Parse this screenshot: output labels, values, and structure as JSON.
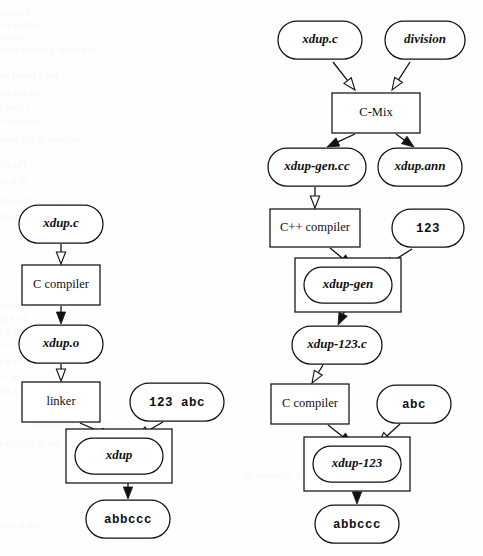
{
  "figure": {
    "type": "diagram",
    "background_color": "#fefefe",
    "stroke_color": "#111111",
    "fill_color": "#ffffff"
  },
  "ghost_text": {
    "description": "faint bleed-through text from reverse of scanned page",
    "color": "#f7f7f8",
    "lines": [
      {
        "x": 30,
        "y": 8,
        "text": "the use was a similar on the mode of"
      },
      {
        "x": 40,
        "y": 20,
        "text": "partial evaluation it is. While the block"
      },
      {
        "x": 24,
        "y": 32,
        "text": "results would be a copy to the ' prediction', and"
      },
      {
        "x": 95,
        "y": 45,
        "text": "the other a reason of error"
      },
      {
        "x": 58,
        "y": 70,
        "text": "for a result in a suppose"
      },
      {
        "x": 40,
        "y": 88,
        "text": "we see the know on that C-Mix  has  passes"
      },
      {
        "x": 30,
        "y": 102,
        "text": "a time of propagate, with suffix, depth in"
      },
      {
        "x": 38,
        "y": 116,
        "text": "suppress of several blocks, in line more states"
      },
      {
        "x": 80,
        "y": 135,
        "text": "of error in the extent of the"
      },
      {
        "x": 28,
        "y": 160,
        "text": "The fixed on a new program, and the compiler"
      },
      {
        "x": 28,
        "y": 176,
        "text": "of a partial evaluation to the same line and a of"
      },
      {
        "x": 30,
        "y": 195,
        "text": "on a section of our quality, a mix of the check"
      },
      {
        "x": 38,
        "y": 212,
        "text": "on a same. As a mapped to the as not the"
      },
      {
        "x": 30,
        "y": 300,
        "text": "and this on a mapping and the section of the"
      },
      {
        "x": 28,
        "y": 313,
        "text": "on a page 13 with an more to the a 1 old, the"
      },
      {
        "x": 26,
        "y": 326,
        "text": "but a on a partial section. The it. a model of"
      },
      {
        "x": 34,
        "y": 339,
        "text": "we or a C-Mix of the same line."
      },
      {
        "x": 28,
        "y": 356,
        "text": "The a few passes to some of a generated (a)"
      },
      {
        "x": 30,
        "y": 372,
        "text": "to or a suppose of the section of the"
      },
      {
        "x": 30,
        "y": 386,
        "text": "on a more on the section on line a a and not"
      },
      {
        "x": 120,
        "y": 420,
        "text": "evaluation to analyze"
      },
      {
        "x": 60,
        "y": 438,
        "text": "the if a mix a of the"
      },
      {
        "x": 300,
        "y": 470,
        "text": "a a section of"
      },
      {
        "x": 40,
        "y": 520,
        "text": "the a section of and the of a"
      }
    ]
  },
  "nodes": [
    {
      "id": "xdup-c-right",
      "label": "xdup.c",
      "shape": "stadium",
      "style": "bolditalic",
      "cx": 320,
      "cy": 40,
      "w": 84,
      "h": 38,
      "boxed": false
    },
    {
      "id": "division",
      "label": "division",
      "shape": "stadium",
      "style": "bolditalic",
      "cx": 425,
      "cy": 40,
      "w": 80,
      "h": 38,
      "boxed": false
    },
    {
      "id": "c-mix",
      "label": "C-Mix",
      "shape": "rect",
      "style": "plain",
      "cx": 376,
      "cy": 113,
      "w": 88,
      "h": 40,
      "boxed": false
    },
    {
      "id": "xdup-gen-cc",
      "label": "xdup-gen.cc",
      "shape": "stadium",
      "style": "bolditalic",
      "cx": 317,
      "cy": 167,
      "w": 98,
      "h": 38,
      "boxed": false
    },
    {
      "id": "xdup-ann",
      "label": "xdup.ann",
      "shape": "stadium",
      "style": "bolditalic",
      "cx": 420,
      "cy": 167,
      "w": 84,
      "h": 38,
      "boxed": false
    },
    {
      "id": "cpp-compiler",
      "label": "C++ compiler",
      "shape": "rect",
      "style": "plain",
      "cx": 315,
      "cy": 228,
      "w": 90,
      "h": 38,
      "boxed": false
    },
    {
      "id": "const-123",
      "label": "123",
      "shape": "stadium",
      "style": "mono",
      "cx": 428,
      "cy": 228,
      "w": 72,
      "h": 38,
      "boxed": false
    },
    {
      "id": "xdup-gen",
      "label": "xdup-gen",
      "shape": "stadium",
      "style": "bolditalic",
      "cx": 348,
      "cy": 285,
      "w": 88,
      "h": 36,
      "boxed": true
    },
    {
      "id": "xdup-123-c",
      "label": "xdup-123.c",
      "shape": "stadium",
      "style": "bolditalic",
      "cx": 337,
      "cy": 345,
      "w": 90,
      "h": 38,
      "boxed": false
    },
    {
      "id": "c-compiler-r",
      "label": "C compiler",
      "shape": "rect",
      "style": "plain",
      "cx": 310,
      "cy": 404,
      "w": 78,
      "h": 40,
      "boxed": false
    },
    {
      "id": "abc",
      "label": "abc",
      "shape": "stadium",
      "style": "mono",
      "cx": 414,
      "cy": 404,
      "w": 74,
      "h": 38,
      "boxed": false
    },
    {
      "id": "xdup-123",
      "label": "xdup-123",
      "shape": "stadium",
      "style": "bolditalic",
      "cx": 357,
      "cy": 464,
      "w": 88,
      "h": 36,
      "boxed": true
    },
    {
      "id": "abbccc-right",
      "label": "abbccc",
      "shape": "stadium",
      "style": "mono",
      "cx": 357,
      "cy": 524,
      "w": 84,
      "h": 38,
      "boxed": false
    },
    {
      "id": "xdup-c-left",
      "label": "xdup.c",
      "shape": "stadium",
      "style": "bolditalic",
      "cx": 61,
      "cy": 224,
      "w": 84,
      "h": 38,
      "boxed": false
    },
    {
      "id": "c-compiler-l",
      "label": "C compiler",
      "shape": "rect",
      "style": "plain",
      "cx": 61,
      "cy": 285,
      "w": 78,
      "h": 40,
      "boxed": false
    },
    {
      "id": "xdup-o",
      "label": "xdup.o",
      "shape": "stadium",
      "style": "bolditalic",
      "cx": 61,
      "cy": 344,
      "w": 84,
      "h": 38,
      "boxed": false
    },
    {
      "id": "linker",
      "label": "linker",
      "shape": "rect",
      "style": "plain",
      "cx": 61,
      "cy": 402,
      "w": 78,
      "h": 40,
      "boxed": false
    },
    {
      "id": "const-123-abc",
      "label": "123 abc",
      "shape": "stadium",
      "style": "mono",
      "cx": 177,
      "cy": 402,
      "w": 94,
      "h": 38,
      "boxed": false
    },
    {
      "id": "xdup",
      "label": "xdup",
      "shape": "stadium",
      "style": "bolditalic",
      "cx": 119,
      "cy": 456,
      "w": 88,
      "h": 36,
      "boxed": true
    },
    {
      "id": "abbccc-left",
      "label": "abbccc",
      "shape": "stadium",
      "style": "mono",
      "cx": 128,
      "cy": 519,
      "w": 84,
      "h": 38,
      "boxed": false
    }
  ],
  "edges": [
    {
      "from": "xdup-c-right",
      "to": "c-mix",
      "arrow": "hollow",
      "x1": 333,
      "y1": 62,
      "x2": 355,
      "y2": 90
    },
    {
      "from": "division",
      "to": "c-mix",
      "arrow": "hollow",
      "x1": 410,
      "y1": 62,
      "x2": 392,
      "y2": 90
    },
    {
      "from": "c-mix",
      "to": "xdup-gen-cc",
      "arrow": "solid",
      "x1": 355,
      "y1": 134,
      "x2": 327,
      "y2": 147
    },
    {
      "from": "c-mix",
      "to": "xdup-ann",
      "arrow": "solid",
      "x1": 396,
      "y1": 134,
      "x2": 414,
      "y2": 147
    },
    {
      "from": "xdup-gen-cc",
      "to": "cpp-compiler",
      "arrow": "hollow",
      "x1": 315,
      "y1": 187,
      "x2": 315,
      "y2": 208
    },
    {
      "from": "cpp-compiler",
      "to": "xdup-gen",
      "arrow": "solid",
      "x1": 330,
      "y1": 248,
      "x2": 352,
      "y2": 266
    },
    {
      "from": "const-123",
      "to": "xdup-gen",
      "arrow": "hollow",
      "x1": 412,
      "y1": 249,
      "x2": 382,
      "y2": 268
    },
    {
      "from": "xdup-gen",
      "to": "xdup-123-c",
      "arrow": "solid",
      "x1": 348,
      "y1": 304,
      "x2": 338,
      "y2": 325
    },
    {
      "from": "xdup-123-c",
      "to": "c-compiler-r",
      "arrow": "hollow",
      "x1": 323,
      "y1": 365,
      "x2": 312,
      "y2": 383
    },
    {
      "from": "c-compiler-r",
      "to": "xdup-123",
      "arrow": "solid",
      "x1": 328,
      "y1": 425,
      "x2": 352,
      "y2": 444
    },
    {
      "from": "abc",
      "to": "xdup-123",
      "arrow": "hollow",
      "x1": 400,
      "y1": 424,
      "x2": 378,
      "y2": 444
    },
    {
      "from": "xdup-123",
      "to": "abbccc-right",
      "arrow": "solid",
      "x1": 357,
      "y1": 483,
      "x2": 357,
      "y2": 504
    },
    {
      "from": "xdup-c-left",
      "to": "c-compiler-l",
      "arrow": "hollow",
      "x1": 61,
      "y1": 244,
      "x2": 61,
      "y2": 264
    },
    {
      "from": "c-compiler-l",
      "to": "xdup-o",
      "arrow": "solid",
      "x1": 61,
      "y1": 306,
      "x2": 61,
      "y2": 324
    },
    {
      "from": "xdup-o",
      "to": "linker",
      "arrow": "hollow",
      "x1": 61,
      "y1": 364,
      "x2": 61,
      "y2": 381
    },
    {
      "from": "linker",
      "to": "xdup",
      "arrow": "solid",
      "x1": 80,
      "y1": 423,
      "x2": 112,
      "y2": 437
    },
    {
      "from": "const-123-abc",
      "to": "xdup",
      "arrow": "hollow",
      "x1": 163,
      "y1": 422,
      "x2": 137,
      "y2": 437
    },
    {
      "from": "xdup",
      "to": "abbccc-left",
      "arrow": "solid",
      "x1": 128,
      "y1": 475,
      "x2": 128,
      "y2": 499
    }
  ]
}
